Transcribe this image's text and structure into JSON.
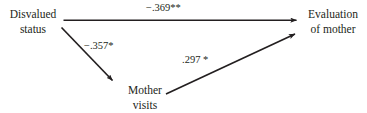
{
  "diagram": {
    "background_color": "#ffffff",
    "stroke_color": "#231f20",
    "text_color": "#231f20",
    "nodes": [
      {
        "id": "disvalued-status",
        "line1": "Disvalued",
        "line2": "status"
      },
      {
        "id": "evaluation-of-mother",
        "line1": "Evaluation",
        "line2": "of mother"
      },
      {
        "id": "mother-visits",
        "line1": "Mother",
        "line2": "visits"
      }
    ],
    "paths": [
      {
        "id": "direct-effect",
        "from": "disvalued-status",
        "to": "evaluation-of-mother",
        "coefficient": "−.369**",
        "value": -0.369,
        "significance": "**"
      },
      {
        "id": "path-a",
        "from": "disvalued-status",
        "to": "mother-visits",
        "coefficient": "−.357*",
        "value": -0.357,
        "significance": "*"
      },
      {
        "id": "path-b",
        "from": "mother-visits",
        "to": "evaluation-of-mother",
        "coefficient": ".297 *",
        "value": 0.297,
        "significance": "*"
      }
    ]
  }
}
